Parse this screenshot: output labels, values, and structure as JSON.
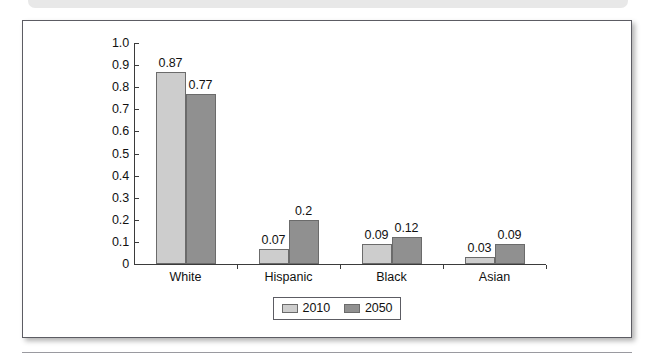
{
  "chart_data": {
    "type": "bar",
    "title": "",
    "xlabel": "",
    "ylabel": "",
    "categories": [
      "White",
      "Hispanic",
      "Black",
      "Asian"
    ],
    "series": [
      {
        "name": "2010",
        "color": "#cdcdcd",
        "values": [
          0.87,
          0.07,
          0.09,
          0.03
        ],
        "labels": [
          "0.87",
          "0.07",
          "0.09",
          "0.03"
        ]
      },
      {
        "name": "2050",
        "color": "#909090",
        "values": [
          0.77,
          0.2,
          0.12,
          0.09
        ],
        "labels": [
          "0.77",
          "0.2",
          "0.12",
          "0.09"
        ]
      }
    ],
    "ylim": [
      0,
      1.0
    ],
    "ytick_values": [
      1.0,
      0.9,
      0.8,
      0.7,
      0.6,
      0.5,
      0.4,
      0.3,
      0.2,
      0.1,
      0
    ],
    "ytick_labels": [
      "1.0",
      "0.9",
      "0.8",
      "0.7",
      "0.6",
      "0.5",
      "0.4",
      "0.3",
      "0.2",
      "0.1",
      "0"
    ],
    "grid": false,
    "legend_position": "bottom-center",
    "legend_entries": [
      "2010",
      "2050"
    ]
  }
}
